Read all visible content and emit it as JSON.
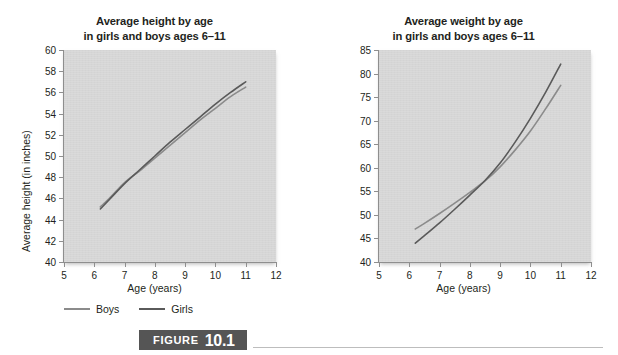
{
  "figure": {
    "word": "FIGURE",
    "number": "10.1",
    "banner_color": "#555555",
    "banner_text_color": "#ffffff",
    "rule_color": "#bdbdbd"
  },
  "legend": {
    "items": [
      {
        "label": "Boys",
        "color": "#8b8b8b",
        "icon": "line-swatch-icon"
      },
      {
        "label": "Girls",
        "color": "#5a5a5a",
        "icon": "line-swatch-icon"
      }
    ]
  },
  "palette": {
    "plot_background": "#d6d6d6",
    "axis": "#8e8e8e",
    "text": "#231f20",
    "boys": "#8b8b8b",
    "girls": "#5a5a5a"
  },
  "chart_data": [
    {
      "id": "height",
      "type": "line",
      "title": "Average height by age\nin girls and boys ages 6–11",
      "title_line1": "Average height by age",
      "title_line2": "in girls and boys ages 6–11",
      "xlabel": "Age (years)",
      "ylabel": "Average height (in inches)",
      "xlim": [
        5,
        12
      ],
      "ylim": [
        40,
        60
      ],
      "xticks": [
        5,
        6,
        7,
        8,
        9,
        10,
        11,
        12
      ],
      "xtick_labels": [
        "5",
        "6",
        "7",
        "8",
        "9",
        "10",
        "11",
        "12"
      ],
      "yticks": [
        40,
        42,
        44,
        46,
        48,
        50,
        52,
        54,
        56,
        58,
        60
      ],
      "ytick_labels": [
        "40",
        "42",
        "44",
        "46",
        "48",
        "50",
        "52",
        "54",
        "56",
        "58",
        "60"
      ],
      "grid": false,
      "legend_position": "below-left",
      "x": [
        6.2,
        6.5,
        7.0,
        7.5,
        8.0,
        8.5,
        9.0,
        9.5,
        10.0,
        10.5,
        11.0
      ],
      "series": [
        {
          "name": "Boys",
          "color": "#8b8b8b",
          "values": [
            45.2,
            46.0,
            47.5,
            48.6,
            49.8,
            51.0,
            52.2,
            53.4,
            54.5,
            55.6,
            56.5
          ]
        },
        {
          "name": "Girls",
          "color": "#5a5a5a",
          "values": [
            45.0,
            45.9,
            47.4,
            48.7,
            50.0,
            51.3,
            52.5,
            53.7,
            54.9,
            56.0,
            57.0
          ]
        }
      ]
    },
    {
      "id": "weight",
      "type": "line",
      "title": "Average weight by age\nin girls and boys ages 6–11",
      "title_line1": "Average weight by age",
      "title_line2": "in girls and boys ages 6–11",
      "xlabel": "Age (years)",
      "ylabel": "Average weight (in pounds)",
      "xlim": [
        5,
        12
      ],
      "ylim": [
        40,
        85
      ],
      "xticks": [
        5,
        6,
        7,
        8,
        9,
        10,
        11,
        12
      ],
      "xtick_labels": [
        "5",
        "6",
        "7",
        "8",
        "9",
        "10",
        "11",
        "12"
      ],
      "yticks": [
        40,
        45,
        50,
        55,
        60,
        65,
        70,
        75,
        80,
        85
      ],
      "ytick_labels": [
        "40",
        "45",
        "50",
        "55",
        "60",
        "65",
        "70",
        "75",
        "80",
        "85"
      ],
      "grid": false,
      "legend_position": "below-left",
      "x": [
        6.2,
        6.5,
        7.0,
        7.5,
        8.0,
        8.5,
        9.0,
        9.5,
        10.0,
        10.5,
        11.0
      ],
      "series": [
        {
          "name": "Boys",
          "color": "#8b8b8b",
          "values": [
            47.0,
            48.2,
            50.3,
            52.5,
            54.8,
            57.2,
            60.2,
            63.8,
            67.8,
            72.5,
            77.5
          ]
        },
        {
          "name": "Girls",
          "color": "#5a5a5a",
          "values": [
            44.0,
            45.6,
            48.3,
            51.2,
            54.2,
            57.3,
            61.0,
            65.5,
            70.5,
            76.0,
            82.0
          ]
        }
      ]
    }
  ]
}
